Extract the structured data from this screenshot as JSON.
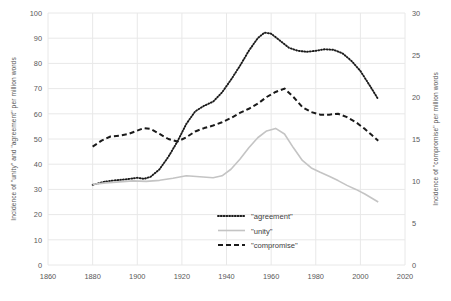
{
  "chart_data": {
    "type": "line",
    "title": "",
    "xlabel": "",
    "ylabel": "Incidence of \"unity\" and \"agreement\" per million words",
    "y2label": "Incidence of \"compromise\" per million words",
    "xlim": [
      1860,
      2020
    ],
    "ylim": [
      0,
      100
    ],
    "y2lim": [
      0,
      30
    ],
    "xticks": [
      1860,
      1880,
      1900,
      1920,
      1940,
      1960,
      1980,
      2000,
      2020
    ],
    "yticks": [
      0,
      10,
      20,
      30,
      40,
      50,
      60,
      70,
      80,
      90,
      100
    ],
    "y2ticks": [
      0,
      5,
      10,
      15,
      20,
      25,
      30
    ],
    "grid": true,
    "legend_position": "inside-bottom-center",
    "series": [
      {
        "name": "\"agreement\"",
        "axis": "left",
        "style": "dotted",
        "color": "#1a1a1a",
        "points": [
          [
            1880,
            31.8
          ],
          [
            1885,
            33.0
          ],
          [
            1890,
            33.6
          ],
          [
            1895,
            34.0
          ],
          [
            1900,
            34.6
          ],
          [
            1903,
            34.2
          ],
          [
            1906,
            35.0
          ],
          [
            1910,
            38.0
          ],
          [
            1914,
            43.0
          ],
          [
            1918,
            49.0
          ],
          [
            1922,
            56.0
          ],
          [
            1926,
            61.0
          ],
          [
            1930,
            63.2
          ],
          [
            1934,
            64.8
          ],
          [
            1938,
            68.5
          ],
          [
            1942,
            73.5
          ],
          [
            1946,
            79.0
          ],
          [
            1950,
            85.0
          ],
          [
            1954,
            90.0
          ],
          [
            1957,
            92.2
          ],
          [
            1960,
            91.8
          ],
          [
            1964,
            89.0
          ],
          [
            1968,
            86.2
          ],
          [
            1972,
            85.0
          ],
          [
            1976,
            84.6
          ],
          [
            1980,
            85.0
          ],
          [
            1984,
            85.6
          ],
          [
            1988,
            85.4
          ],
          [
            1992,
            84.0
          ],
          [
            1996,
            81.0
          ],
          [
            2000,
            77.0
          ],
          [
            2004,
            71.5
          ],
          [
            2008,
            65.8
          ]
        ]
      },
      {
        "name": "\"unity\"",
        "axis": "left",
        "style": "solid",
        "color": "#c4c4c4",
        "points": [
          [
            1880,
            32.0
          ],
          [
            1886,
            32.6
          ],
          [
            1892,
            33.0
          ],
          [
            1898,
            33.4
          ],
          [
            1904,
            33.2
          ],
          [
            1910,
            33.6
          ],
          [
            1916,
            34.4
          ],
          [
            1922,
            35.4
          ],
          [
            1928,
            35.0
          ],
          [
            1934,
            34.6
          ],
          [
            1938,
            35.4
          ],
          [
            1942,
            38.0
          ],
          [
            1946,
            42.0
          ],
          [
            1950,
            46.5
          ],
          [
            1954,
            50.5
          ],
          [
            1958,
            53.2
          ],
          [
            1962,
            54.2
          ],
          [
            1966,
            52.0
          ],
          [
            1970,
            46.5
          ],
          [
            1974,
            41.5
          ],
          [
            1978,
            38.5
          ],
          [
            1982,
            36.8
          ],
          [
            1986,
            35.2
          ],
          [
            1990,
            33.5
          ],
          [
            1994,
            31.6
          ],
          [
            1998,
            30.0
          ],
          [
            2002,
            28.2
          ],
          [
            2005,
            26.6
          ],
          [
            2008,
            25.0
          ]
        ]
      },
      {
        "name": "\"compromise\"",
        "axis": "right",
        "style": "dashed",
        "color": "#1a1a1a",
        "points": [
          [
            1880,
            14.1
          ],
          [
            1884,
            14.8
          ],
          [
            1888,
            15.3
          ],
          [
            1892,
            15.4
          ],
          [
            1896,
            15.6
          ],
          [
            1900,
            16.0
          ],
          [
            1903,
            16.3
          ],
          [
            1906,
            16.2
          ],
          [
            1910,
            15.6
          ],
          [
            1914,
            15.0
          ],
          [
            1918,
            14.7
          ],
          [
            1922,
            15.2
          ],
          [
            1926,
            15.9
          ],
          [
            1930,
            16.3
          ],
          [
            1934,
            16.6
          ],
          [
            1938,
            17.0
          ],
          [
            1942,
            17.5
          ],
          [
            1946,
            18.1
          ],
          [
            1950,
            18.6
          ],
          [
            1954,
            19.2
          ],
          [
            1958,
            20.0
          ],
          [
            1962,
            20.6
          ],
          [
            1966,
            21.0
          ],
          [
            1970,
            20.0
          ],
          [
            1974,
            18.8
          ],
          [
            1978,
            18.2
          ],
          [
            1982,
            17.9
          ],
          [
            1986,
            17.9
          ],
          [
            1990,
            18.0
          ],
          [
            1994,
            17.6
          ],
          [
            1998,
            17.0
          ],
          [
            2002,
            16.2
          ],
          [
            2005,
            15.5
          ],
          [
            2008,
            14.8
          ]
        ]
      }
    ]
  },
  "legend": {
    "entries": [
      {
        "label": "\"agreement\"",
        "style": "dotted",
        "color": "#1a1a1a"
      },
      {
        "label": "\"unity\"",
        "style": "solid",
        "color": "#c4c4c4"
      },
      {
        "label": "\"compromise\"",
        "style": "dashed",
        "color": "#1a1a1a"
      }
    ]
  },
  "colors": {
    "grid": "#e8e8e8",
    "text": "#595959",
    "agreement": "#1a1a1a",
    "unity": "#c4c4c4",
    "compromise": "#1a1a1a"
  }
}
